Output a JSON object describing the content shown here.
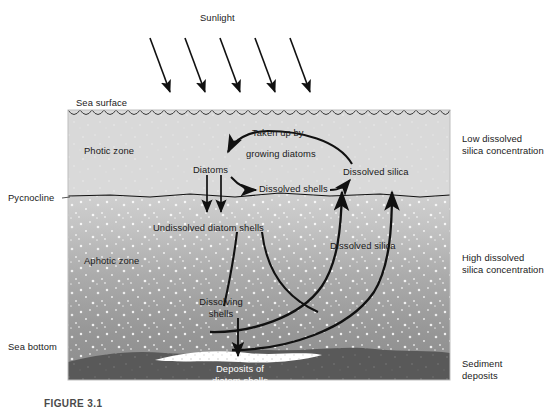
{
  "figure": {
    "caption": "FIGURE 3.1",
    "type": "diagram"
  },
  "top": {
    "sunlight_label": "Sunlight",
    "ray_count": 5
  },
  "left_labels": {
    "sea_surface": "Sea surface",
    "pycnocline": "Pycnocline",
    "sea_bottom": "Sea bottom"
  },
  "right_labels": {
    "low_silica_line1": "Low dissolved",
    "low_silica_line2": "silica concentration",
    "high_silica_line1": "High dissolved",
    "high_silica_line2": "silica concentration",
    "sediment_line1": "Sediment",
    "sediment_line2": "deposits"
  },
  "zones": {
    "photic": "Photic zone",
    "aphotic": "Aphotic zone"
  },
  "flow_labels": {
    "taken_up_line1": "Taken up by",
    "taken_up_line2": "growing diatoms",
    "diatoms": "Diatoms",
    "dissolved_shells": "Dissolved shells",
    "dissolved_silica_top": "Dissolved silica",
    "undissolved_shells": "Undissolved diatom shells",
    "dissolved_silica_mid": "Dissolved silica",
    "dissolving_line1": "Dissolving",
    "dissolving_line2": "shells",
    "deposits_line1": "Deposits of",
    "deposits_line2": "diatom shells"
  },
  "colors": {
    "photic_zone": "#d9d9d9",
    "aphotic_top": "#cfcfcf",
    "aphotic_bottom": "#8d8d8d",
    "sea_bottom": "#595959",
    "deposit": "#ffffff",
    "stroke": "#111111",
    "text": "#1a1a1a",
    "caption": "#4a4a4a"
  }
}
